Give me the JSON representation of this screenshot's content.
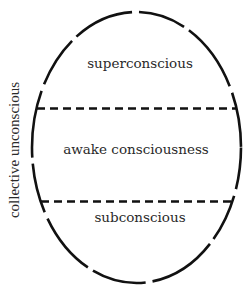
{
  "diagram": {
    "side_label": "collective unconscious",
    "regions": [
      {
        "id": "superconscious",
        "label": "superconscious"
      },
      {
        "id": "awake",
        "label": "awake consciousness"
      },
      {
        "id": "subconscious",
        "label": "subconscious"
      }
    ],
    "colors": {
      "stroke": "#111111",
      "text": "#2a2a2a",
      "background": "#ffffff"
    },
    "outline_style": "broken-ellipse",
    "divider_style": "dashed"
  }
}
